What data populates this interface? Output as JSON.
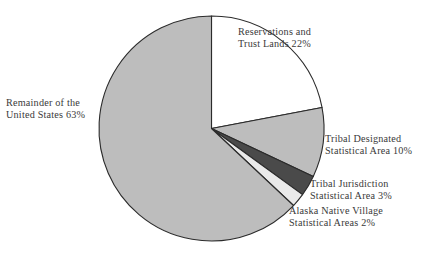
{
  "chart_data": {
    "type": "pie",
    "title": "",
    "subtitle": "",
    "legend_position": "none",
    "grid": false,
    "start_angle_deg": 0,
    "direction": "clockwise",
    "categories": [
      "Reservations and Trust Lands",
      "Tribal Designated Statistical Area",
      "Tribal Jurisdiction Statistical Area",
      "Alaska Native Village Statistical Areas",
      "Remainder of the United States"
    ],
    "values": [
      22,
      10,
      3,
      2,
      63
    ],
    "unit": "%",
    "slices": [
      {
        "name": "Reservations and Trust Lands",
        "value": 22,
        "value_text": "22%",
        "color": "#ffffff",
        "stroke": "#2b2b2b",
        "label_lines": [
          "Reservations and",
          "Trust Lands 22%"
        ]
      },
      {
        "name": "Tribal Designated Statistical Area",
        "value": 10,
        "value_text": "10%",
        "color": "#bdbdbd",
        "stroke": "#2b2b2b",
        "label_lines": [
          "Tribal Designated",
          "Statistical Area 10%"
        ]
      },
      {
        "name": "Tribal Jurisdiction Statistical Area",
        "value": 3,
        "value_text": "3%",
        "color": "#4a4a4a",
        "stroke": "#2b2b2b",
        "label_lines": [
          "Tribal Jurisdiction",
          "Statistical Area 3%"
        ]
      },
      {
        "name": "Alaska Native Village Statistical Areas",
        "value": 2,
        "value_text": "2%",
        "color": "#eaeaea",
        "stroke": "#2b2b2b",
        "label_lines": [
          "Alaska Native Village",
          "Statistical Areas 2%"
        ]
      },
      {
        "name": "Remainder of the United States",
        "value": 63,
        "value_text": "63%",
        "color": "#bdbdbd",
        "stroke": "#2b2b2b",
        "label_lines": [
          "Remainder of the",
          "United States 63%"
        ]
      }
    ]
  },
  "labels": {
    "reservations": {
      "line1": "Reservations and",
      "line2": "Trust Lands 22%"
    },
    "remainder": {
      "line1": "Remainder of the",
      "line2": "United States 63%"
    },
    "tribal_designated": {
      "line1": "Tribal Designated",
      "line2": "Statistical Area 10%"
    },
    "tribal_jurisdiction": {
      "line1": "Tribal Jurisdiction",
      "line2": "Statistical Area 3%"
    },
    "alaska": {
      "line1": "Alaska Native Village",
      "line2": "Statistical Areas 2%"
    }
  },
  "colors": {
    "slice_gray": "#bdbdbd",
    "slice_dark": "#4a4a4a",
    "slice_light": "#eaeaea",
    "slice_white": "#ffffff",
    "outline": "#2b2b2b",
    "text": "#3a3a3a",
    "background": "#ffffff"
  }
}
